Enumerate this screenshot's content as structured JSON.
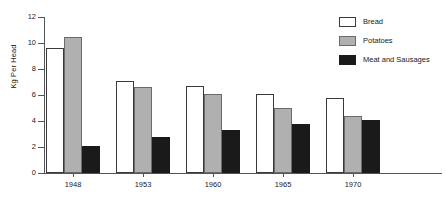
{
  "chart_data": {
    "type": "bar",
    "title": "",
    "subtitle": "",
    "xlabel": "",
    "ylabel": "Kg Per Head",
    "categories": [
      "1948",
      "1953",
      "1960",
      "1965",
      "1970"
    ],
    "series": [
      {
        "name": "Bread",
        "color": "#ffffff",
        "edge_color": "#3a3a3a",
        "values": [
          9.65,
          7.1,
          6.7,
          6.05,
          5.8
        ]
      },
      {
        "name": "Potatoes",
        "color": "#b0b0b0",
        "edge_color": "#6a6a6a",
        "values": [
          10.5,
          6.65,
          6.1,
          5.0,
          4.4
        ]
      },
      {
        "name": "Meat and Sausages",
        "color": "#1a1a1a",
        "edge_color": "#1a1a1a",
        "values": [
          2.1,
          2.8,
          3.3,
          3.75,
          4.1
        ]
      }
    ],
    "ylim": [
      0,
      12
    ],
    "yticks": [
      0,
      2,
      4,
      6,
      8,
      10,
      12
    ],
    "ytick_labels": [
      "0",
      "2",
      "4",
      "6",
      "8",
      "10",
      "12"
    ],
    "grid": false,
    "legend_position": "top-right",
    "axis_color": "#555555"
  }
}
